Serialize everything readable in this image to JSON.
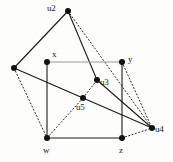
{
  "figure": {
    "type": "graph-diagram",
    "title": "",
    "background_color": "#fdfdfb",
    "stroke_color": "#1a1a1a",
    "faint_edge_color": "#9a9a9a",
    "node_fill": "#111111"
  },
  "nodes": [
    {
      "id": "u1",
      "label": "",
      "x": 14,
      "y": 68,
      "label_x": 0,
      "label_y": 0,
      "labeled": false
    },
    {
      "id": "u2",
      "label": "u2",
      "x": 68,
      "y": 11,
      "label_x": 47,
      "label_y": 4,
      "labeled": true
    },
    {
      "id": "x",
      "label": "x",
      "x": 47,
      "y": 62,
      "label_x": 52,
      "label_y": 50,
      "labeled": true
    },
    {
      "id": "y",
      "label": "y",
      "x": 122,
      "y": 62,
      "label_x": 128,
      "label_y": 55,
      "labeled": true
    },
    {
      "id": "u3",
      "label": "u3",
      "x": 97,
      "y": 80,
      "label_x": 100,
      "label_y": 78,
      "labeled": true
    },
    {
      "id": "u5",
      "label": "u5",
      "x": 83,
      "y": 98,
      "label_x": 76,
      "label_y": 103,
      "labeled": true
    },
    {
      "id": "u4",
      "label": "u4",
      "x": 152,
      "y": 128,
      "label_x": 155,
      "label_y": 125,
      "labeled": true
    },
    {
      "id": "w",
      "label": "w",
      "x": 47,
      "y": 138,
      "label_x": 43,
      "label_y": 146,
      "labeled": true
    },
    {
      "id": "z",
      "label": "z",
      "x": 122,
      "y": 138,
      "label_x": 119,
      "label_y": 146,
      "labeled": true
    }
  ],
  "edges": [
    {
      "from": "u2",
      "to": "u1",
      "style": "solid",
      "color": "#1a1a1a"
    },
    {
      "from": "u2",
      "to": "u3",
      "style": "solid",
      "color": "#1a1a1a"
    },
    {
      "from": "u2",
      "to": "u4",
      "style": "dotted",
      "color": "#2a2a2a"
    },
    {
      "from": "u1",
      "to": "u4",
      "style": "solid",
      "color": "#1a1a1a"
    },
    {
      "from": "u1",
      "to": "w",
      "style": "dotted",
      "color": "#2a2a2a"
    },
    {
      "from": "x",
      "to": "y",
      "style": "solid",
      "color": "#9a9a9a"
    },
    {
      "from": "x",
      "to": "w",
      "style": "solid",
      "color": "#1a1a1a"
    },
    {
      "from": "y",
      "to": "z",
      "style": "solid",
      "color": "#1a1a1a"
    },
    {
      "from": "y",
      "to": "u4",
      "style": "dotted",
      "color": "#2a2a2a"
    },
    {
      "from": "w",
      "to": "z",
      "style": "solid",
      "color": "#1a1a1a"
    },
    {
      "from": "w",
      "to": "u5",
      "style": "dotted",
      "color": "#2a2a2a"
    },
    {
      "from": "u5",
      "to": "u3",
      "style": "dotted",
      "color": "#2a2a2a"
    },
    {
      "from": "u3",
      "to": "u4",
      "style": "solid",
      "color": "#1a1a1a"
    },
    {
      "from": "z",
      "to": "u4",
      "style": "dotted",
      "color": "#2a2a2a"
    }
  ]
}
